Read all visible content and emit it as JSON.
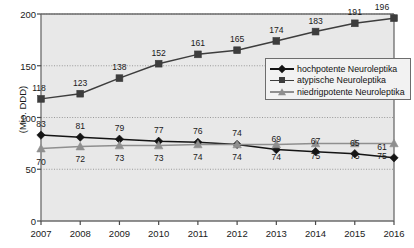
{
  "chart_data": {
    "type": "line",
    "title": "",
    "xlabel": "",
    "ylabel": "(Mio. DDD)",
    "categories": [
      "2007",
      "2008",
      "2009",
      "2010",
      "2011",
      "2012",
      "2013",
      "2014",
      "2015",
      "2016"
    ],
    "ylim": [
      0,
      200
    ],
    "yticks": [
      0,
      50,
      100,
      150,
      200
    ],
    "grid": true,
    "legend_position": "center-right",
    "plot_background": "#e8e8e8",
    "series": [
      {
        "name": "hochpotente Neuroleptika",
        "marker": "diamond",
        "color": "#141414",
        "label_position": "above",
        "values": [
          83,
          81,
          79,
          77,
          76,
          74,
          69,
          67,
          65,
          61
        ],
        "labels": [
          "83",
          "81",
          "79",
          "77",
          "76",
          "74",
          "69",
          "67",
          "65",
          "61"
        ]
      },
      {
        "name": "atypische Neuroleptika",
        "marker": "square",
        "color": "#3d3d3d",
        "label_position": "above",
        "values": [
          118,
          123,
          138,
          152,
          161,
          165,
          174,
          183,
          191,
          196
        ],
        "labels": [
          "118",
          "123",
          "138",
          "152",
          "161",
          "165",
          "174",
          "183",
          "191",
          "196"
        ]
      },
      {
        "name": "niedrigpotente Neuroleptika",
        "marker": "triangle",
        "color": "#8f8f8f",
        "label_position": "below",
        "values": [
          70,
          72,
          73,
          73,
          74,
          74,
          74,
          75,
          75,
          75
        ],
        "labels": [
          "70",
          "72",
          "73",
          "73",
          "74",
          "74",
          "74",
          "75",
          "75",
          "75"
        ]
      }
    ]
  }
}
